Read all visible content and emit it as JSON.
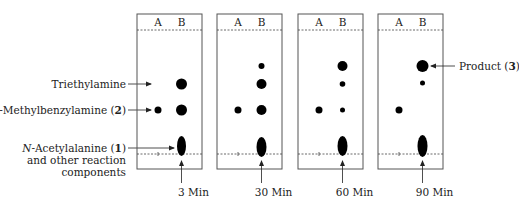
{
  "figure": {
    "type": "TLC time-course diagram",
    "lane_labels": [
      "A",
      "B"
    ],
    "plates": [
      {
        "time_label": "3 Min",
        "x": 137,
        "spots": [
          {
            "lane": "A",
            "cy": 110,
            "rx": 3.5,
            "ry": 3.5
          },
          {
            "lane": "B",
            "cy": 84,
            "rx": 5.5,
            "ry": 5.5
          },
          {
            "lane": "B",
            "cy": 110,
            "rx": 5.5,
            "ry": 5.5
          },
          {
            "lane": "B",
            "cy": 146,
            "rx": 4.5,
            "ry": 10
          }
        ]
      },
      {
        "time_label": "30 Min",
        "x": 217,
        "spots": [
          {
            "lane": "A",
            "cy": 110,
            "rx": 3.5,
            "ry": 3.5
          },
          {
            "lane": "B",
            "cy": 66,
            "rx": 3,
            "ry": 3
          },
          {
            "lane": "B",
            "cy": 84,
            "rx": 5,
            "ry": 5
          },
          {
            "lane": "B",
            "cy": 110,
            "rx": 5,
            "ry": 5
          },
          {
            "lane": "B",
            "cy": 147,
            "rx": 5,
            "ry": 10
          }
        ]
      },
      {
        "time_label": "60 Min",
        "x": 298,
        "spots": [
          {
            "lane": "A",
            "cy": 110,
            "rx": 3.5,
            "ry": 3.5
          },
          {
            "lane": "B",
            "cy": 66,
            "rx": 5,
            "ry": 5
          },
          {
            "lane": "B",
            "cy": 84,
            "rx": 2.8,
            "ry": 2.8
          },
          {
            "lane": "B",
            "cy": 110,
            "rx": 2.5,
            "ry": 2.5
          },
          {
            "lane": "B",
            "cy": 146,
            "rx": 5,
            "ry": 10
          }
        ]
      },
      {
        "time_label": "90 Min",
        "x": 378,
        "spots": [
          {
            "lane": "A",
            "cy": 110,
            "rx": 3.5,
            "ry": 3.5
          },
          {
            "lane": "B",
            "cy": 66,
            "rx": 6,
            "ry": 6
          },
          {
            "lane": "B",
            "cy": 83,
            "rx": 2.5,
            "ry": 2.5
          },
          {
            "lane": "B",
            "cy": 146,
            "rx": 5,
            "ry": 11
          }
        ]
      }
    ],
    "left_labels": {
      "triethylamine": "Triethylamine",
      "methylbenzylamine_prefix": "N",
      "methylbenzylamine_rest": "-Methylbenzylamine (",
      "methylbenzylamine_num": "2",
      "methylbenzylamine_close": ")",
      "acetylalanine_prefix": "N",
      "acetylalanine_rest": "-Acetylalanine (",
      "acetylalanine_num": "1",
      "acetylalanine_close": ")",
      "acetylalanine_line2": "and other reaction",
      "acetylalanine_line3": "components"
    },
    "right_labels": {
      "product_text": "Product (",
      "product_num": "3",
      "product_close": ")"
    },
    "colors": {
      "plate_border": "#555555",
      "spot": "#000000",
      "dashed_line": "#444444",
      "text": "#222222"
    }
  }
}
